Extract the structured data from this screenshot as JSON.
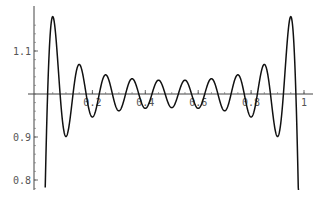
{
  "chart_data": {
    "type": "line",
    "title": "",
    "xlabel": "",
    "ylabel": "",
    "xlim": [
      0,
      1
    ],
    "ylim": [
      0.78,
      1.19
    ],
    "grid": false,
    "legend": null,
    "x_ticks": [
      {
        "value": 0.2,
        "label": "0.2"
      },
      {
        "value": 0.4,
        "label": "0.4"
      },
      {
        "value": 0.6,
        "label": "0.6"
      },
      {
        "value": 0.8,
        "label": "0.8"
      },
      {
        "value": 1.0,
        "label": "1"
      }
    ],
    "y_ticks": [
      {
        "value": 1.1,
        "label": "1.1"
      },
      {
        "value": 0.9,
        "label": "0.9"
      },
      {
        "value": 0.8,
        "label": "0.8"
      }
    ],
    "series": [
      {
        "name": "partial Fourier sum of square wave (odd harmonics 1..19)",
        "formula": "(4/pi) * sum_{k odd, 1..19} sin(k*pi*x)/k",
        "harmonics": [
          1,
          3,
          5,
          7,
          9,
          11,
          13,
          15,
          17,
          19
        ],
        "x_range": [
          0,
          1
        ],
        "extrema": [
          {
            "x": 0.038,
            "y": 1.177
          },
          {
            "x": 0.088,
            "y": 0.905
          },
          {
            "x": 0.143,
            "y": 1.07
          },
          {
            "x": 0.19,
            "y": 0.944
          },
          {
            "x": 0.245,
            "y": 1.05
          },
          {
            "x": 0.3,
            "y": 0.956
          },
          {
            "x": 0.345,
            "y": 1.04
          },
          {
            "x": 0.4,
            "y": 0.96
          },
          {
            "x": 0.45,
            "y": 1.04
          },
          {
            "x": 0.5,
            "y": 0.963
          },
          {
            "x": 0.55,
            "y": 1.04
          },
          {
            "x": 0.6,
            "y": 0.96
          },
          {
            "x": 0.655,
            "y": 1.04
          },
          {
            "x": 0.7,
            "y": 0.956
          },
          {
            "x": 0.755,
            "y": 1.05
          },
          {
            "x": 0.81,
            "y": 0.944
          },
          {
            "x": 0.857,
            "y": 1.07
          },
          {
            "x": 0.912,
            "y": 0.905
          },
          {
            "x": 0.962,
            "y": 1.177
          }
        ]
      }
    ]
  }
}
